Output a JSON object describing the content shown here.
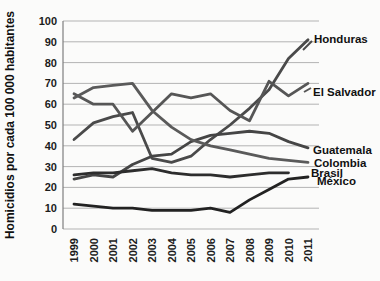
{
  "chart_data": {
    "type": "line",
    "title": "",
    "xlabel": "",
    "ylabel": "Homicidios por cada 100 000 habitantes",
    "x": [
      1999,
      2000,
      2001,
      2002,
      2003,
      2004,
      2005,
      2006,
      2007,
      2008,
      2009,
      2010,
      2011
    ],
    "ylim": [
      0,
      100
    ],
    "ytick_step": 10,
    "grid": true,
    "legend_position": "end-of-line-labels",
    "series": [
      {
        "name": "Honduras",
        "color": "#4a4a4a",
        "values": [
          43,
          51,
          54,
          56,
          34,
          32,
          35,
          43,
          50,
          58,
          67,
          82,
          91
        ]
      },
      {
        "name": "El Salvador",
        "color": "#565656",
        "values": [
          65,
          60,
          60,
          47,
          56,
          65,
          63,
          65,
          57,
          52,
          71,
          64,
          70
        ]
      },
      {
        "name": "Guatemala",
        "color": "#454545",
        "values": [
          24,
          26,
          25,
          31,
          35,
          36,
          42,
          45,
          46,
          47,
          46,
          42,
          39
        ]
      },
      {
        "name": "Colombia",
        "color": "#5a5a5a",
        "values": [
          63,
          68,
          69,
          70,
          57,
          49,
          43,
          40,
          38,
          36,
          34,
          33,
          32
        ]
      },
      {
        "name": "Brasil",
        "color": "#2d2d2d",
        "values": [
          26,
          27,
          27,
          28,
          29,
          27,
          26,
          26,
          25,
          26,
          27,
          27,
          null
        ]
      },
      {
        "name": "México",
        "color": "#222222",
        "values": [
          12,
          11,
          10,
          10,
          9,
          9,
          9,
          10,
          8,
          14,
          19,
          24,
          25
        ]
      }
    ]
  }
}
